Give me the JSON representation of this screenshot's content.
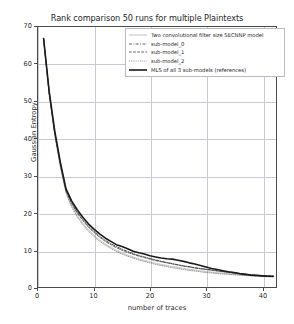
{
  "chart_data": {
    "type": "line",
    "title": "Rank comparison 50 runs for multiple Plaintexts",
    "xlabel": "number of traces",
    "ylabel": "Gaussian Entropy",
    "xlim": [
      0,
      42.5
    ],
    "ylim": [
      0,
      70
    ],
    "xticks": [
      0,
      10,
      20,
      30,
      40
    ],
    "yticks": [
      0,
      10,
      20,
      30,
      40,
      50,
      60,
      70
    ],
    "grid": true,
    "legend_position": "upper right",
    "series": [
      {
        "name": "Two convolutional filter size SECNNP model",
        "style": "solid-light",
        "color": "#b0b0b0",
        "width": 0.7,
        "x": [
          1,
          2,
          3,
          4,
          5,
          6,
          7,
          8,
          9,
          10,
          11,
          12,
          13,
          14,
          15,
          16,
          17,
          18,
          19,
          20,
          21,
          22,
          23,
          24,
          25,
          26,
          27,
          28,
          29,
          30,
          31,
          32,
          33,
          34,
          35,
          36,
          37,
          38,
          39,
          40,
          41,
          42
        ],
        "y": [
          66.8,
          52.0,
          41.0,
          32.5,
          25.6,
          22.0,
          19.3,
          17.2,
          15.4,
          14.0,
          12.7,
          11.6,
          10.7,
          9.9,
          9.2,
          8.6,
          8.1,
          7.6,
          7.2,
          6.8,
          6.4,
          6.1,
          5.8,
          5.5,
          5.3,
          5.0,
          4.8,
          4.6,
          4.4,
          4.2,
          4.0,
          3.9,
          3.7,
          3.6,
          3.4,
          3.3,
          3.2,
          3.1,
          3.0,
          2.9,
          2.8,
          2.7
        ]
      },
      {
        "name": "sub-model_0",
        "style": "dashdot",
        "color": "#3a3a3a",
        "width": 0.8,
        "x": [
          1,
          2,
          3,
          4,
          5,
          6,
          7,
          8,
          9,
          10,
          11,
          12,
          13,
          14,
          15,
          16,
          17,
          18,
          19,
          20,
          21,
          22,
          23,
          24,
          25,
          26,
          27,
          28,
          29,
          30,
          31,
          32,
          33,
          34,
          35,
          36,
          37,
          38,
          39,
          40,
          41,
          42
        ],
        "y": [
          66.9,
          52.4,
          41.6,
          33.2,
          26.2,
          22.8,
          20.2,
          18.2,
          16.4,
          15.0,
          13.7,
          12.6,
          11.7,
          10.9,
          10.2,
          9.6,
          9.0,
          8.5,
          8.1,
          7.7,
          7.3,
          6.9,
          6.6,
          6.3,
          6.0,
          5.7,
          5.5,
          5.2,
          5.0,
          4.8,
          4.6,
          4.4,
          4.2,
          4.0,
          3.8,
          3.6,
          3.5,
          3.3,
          3.2,
          3.1,
          3.0,
          2.9
        ]
      },
      {
        "name": "sub-model_1",
        "style": "dashed",
        "color": "#3a3a3a",
        "width": 0.8,
        "x": [
          1,
          2,
          3,
          4,
          5,
          6,
          7,
          8,
          9,
          10,
          11,
          12,
          13,
          14,
          15,
          16,
          17,
          18,
          19,
          20,
          21,
          22,
          23,
          24,
          25,
          26,
          27,
          28,
          29,
          30,
          31,
          32,
          33,
          34,
          35,
          36,
          37,
          38,
          39,
          40,
          41,
          42
        ],
        "y": [
          66.7,
          52.2,
          41.3,
          32.9,
          25.9,
          22.5,
          19.9,
          17.9,
          16.1,
          14.7,
          13.4,
          12.3,
          11.4,
          10.6,
          9.9,
          9.3,
          8.8,
          8.3,
          7.9,
          7.5,
          7.1,
          6.8,
          6.5,
          6.2,
          5.9,
          5.6,
          5.4,
          5.1,
          4.9,
          4.7,
          4.5,
          4.3,
          4.1,
          3.9,
          3.7,
          3.6,
          3.4,
          3.3,
          3.2,
          3.1,
          3.0,
          2.9
        ]
      },
      {
        "name": "sub-model_2",
        "style": "dotted",
        "color": "#6a6a6a",
        "width": 0.7,
        "x": [
          1,
          2,
          3,
          4,
          5,
          6,
          7,
          8,
          9,
          10,
          11,
          12,
          13,
          14,
          15,
          16,
          17,
          18,
          19,
          20,
          21,
          22,
          23,
          24,
          25,
          26,
          27,
          28,
          29,
          30,
          31,
          32,
          33,
          34,
          35,
          36,
          37,
          38,
          39,
          40,
          41,
          42
        ],
        "y": [
          66.5,
          51.8,
          40.8,
          32.2,
          25.3,
          21.6,
          18.9,
          16.8,
          15.0,
          13.6,
          12.3,
          11.3,
          10.4,
          9.6,
          8.9,
          8.3,
          7.8,
          7.3,
          6.9,
          6.5,
          6.1,
          5.8,
          5.5,
          5.2,
          5.0,
          4.7,
          4.5,
          4.3,
          4.1,
          3.9,
          3.8,
          3.6,
          3.5,
          3.4,
          3.3,
          3.2,
          3.1,
          3.0,
          2.9,
          2.8,
          2.8,
          2.7
        ]
      },
      {
        "name": "MLS of all 3 sub-models (references)",
        "style": "solid-thick",
        "color": "#1a1a1a",
        "width": 1.6,
        "x": [
          1,
          2,
          3,
          4,
          5,
          6,
          7,
          8,
          9,
          10,
          11,
          12,
          13,
          14,
          15,
          16,
          17,
          18,
          19,
          20,
          21,
          22,
          23,
          24,
          25,
          26,
          27,
          28,
          29,
          30,
          31,
          32,
          33,
          34,
          35,
          36,
          37,
          38,
          39,
          40,
          41,
          42
        ],
        "y": [
          66.9,
          52.6,
          41.9,
          33.5,
          26.4,
          23.2,
          20.8,
          18.8,
          17.0,
          15.6,
          14.3,
          13.2,
          12.3,
          11.4,
          10.9,
          10.3,
          9.6,
          9.2,
          8.9,
          8.4,
          8.1,
          7.8,
          7.6,
          7.5,
          7.2,
          6.9,
          6.5,
          6.2,
          5.8,
          5.4,
          5.0,
          4.7,
          4.4,
          4.1,
          3.9,
          3.6,
          3.4,
          3.2,
          3.1,
          3.0,
          2.9,
          2.9
        ]
      }
    ]
  },
  "axes": {
    "ytick_labels": [
      "0",
      "10",
      "20",
      "30",
      "40",
      "50",
      "60",
      "70"
    ],
    "xtick_labels": [
      "0",
      "10",
      "20",
      "30",
      "40"
    ]
  }
}
